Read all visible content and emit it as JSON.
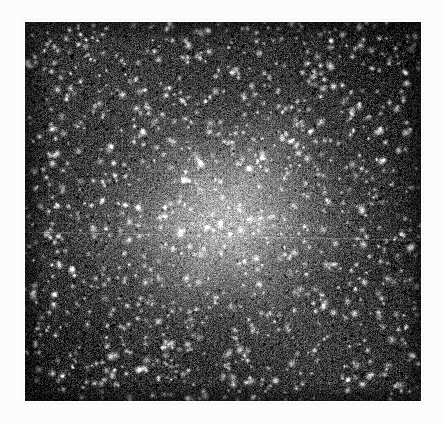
{
  "document": {
    "kind": "grayscale-raster-image",
    "background_color": "#fdfdfd",
    "width": 446,
    "height": 425,
    "caption": "",
    "title": "",
    "labels": [],
    "axis_labels": [],
    "tick_labels": [],
    "legend_entries": [],
    "annotations": []
  },
  "plate": {
    "name": "noise-field-plate",
    "x": 25,
    "y": 22,
    "width": 396,
    "height": 379,
    "border_color": "#141414",
    "base_color": "#1a1a1a",
    "mid_color": "#4a4a4a",
    "core_color": "#a8a8a8",
    "speckle_color": "#f2f2f2",
    "description": "Dense grayscale speckle field, bright diffuse core near center, dark corners"
  },
  "chart_data": {
    "type": "heatmap",
    "title": "",
    "xlabel": "",
    "ylabel": "",
    "grid": false,
    "legend": "none",
    "colormap": "grayscale",
    "value_range": [
      0,
      255
    ],
    "xlim": [
      0,
      396
    ],
    "ylim": [
      0,
      379
    ],
    "structure": {
      "center_x": 0.5,
      "center_y": 0.53,
      "core_radius_frac": 0.17,
      "core_peak_value": 178,
      "halo_radius_frac": 0.46,
      "halo_value": 92,
      "corner_value": 28,
      "background_mean": 46,
      "noise_sigma": 34,
      "speckle_density_per_1000px": 7.5,
      "speckle_peak_value": 245
    },
    "artifacts": [
      {
        "name": "horizontal-scanline",
        "type": "line",
        "orientation": "horizontal",
        "y_start_frac": 0.553,
        "y_end_frac": 0.575,
        "brightness_delta": 46,
        "thickness_px": 1
      },
      {
        "name": "horizontal-scanline-secondary",
        "type": "line",
        "orientation": "horizontal",
        "y_start_frac": 0.528,
        "y_end_frac": 0.548,
        "brightness_delta": 22,
        "thickness_px": 1
      },
      {
        "name": "vertical-faint-streak",
        "type": "line",
        "orientation": "vertical",
        "x_frac": 0.495,
        "brightness_delta": 14,
        "thickness_px": 1
      }
    ]
  }
}
